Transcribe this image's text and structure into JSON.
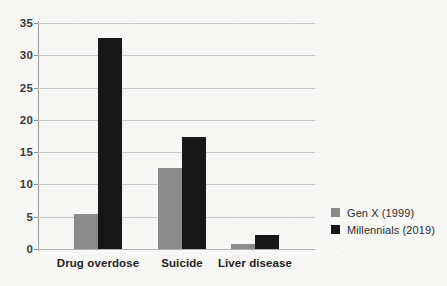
{
  "chart_data": {
    "type": "bar",
    "title": "",
    "subtitle": "",
    "xlabel": "",
    "ylabel": "",
    "categories": [
      "Drug overdose",
      "Suicide",
      "Liver disease"
    ],
    "series": [
      {
        "name": "Gen X (1999)",
        "color": "#8b8b8b",
        "values": [
          5.5,
          12.5,
          0.8
        ]
      },
      {
        "name": "Millennials (2019)",
        "color": "#171717",
        "values": [
          32.7,
          17.3,
          2.2
        ]
      }
    ],
    "ylim": [
      0,
      35
    ],
    "yticks": [
      0,
      5,
      10,
      15,
      20,
      25,
      30,
      35
    ],
    "ytick_labels": [
      "0",
      "5",
      "10",
      "15",
      "20",
      "25",
      "30",
      "35"
    ],
    "grid": true,
    "grid_axis": "y",
    "legend_position": "right",
    "annotations": []
  },
  "legend": {
    "entries": [
      {
        "label": "Gen X (1999)",
        "color": "#8b8b8b"
      },
      {
        "label": "Millennials (2019)",
        "color": "#171717"
      }
    ]
  },
  "colors": {
    "background": "#f7f7f5",
    "gridline": "#c9c9c9",
    "axis": "#9a9a9a",
    "tick_text": "#3a3a3a",
    "category_text": "#232323",
    "legend_text": "#2d2d2d"
  }
}
